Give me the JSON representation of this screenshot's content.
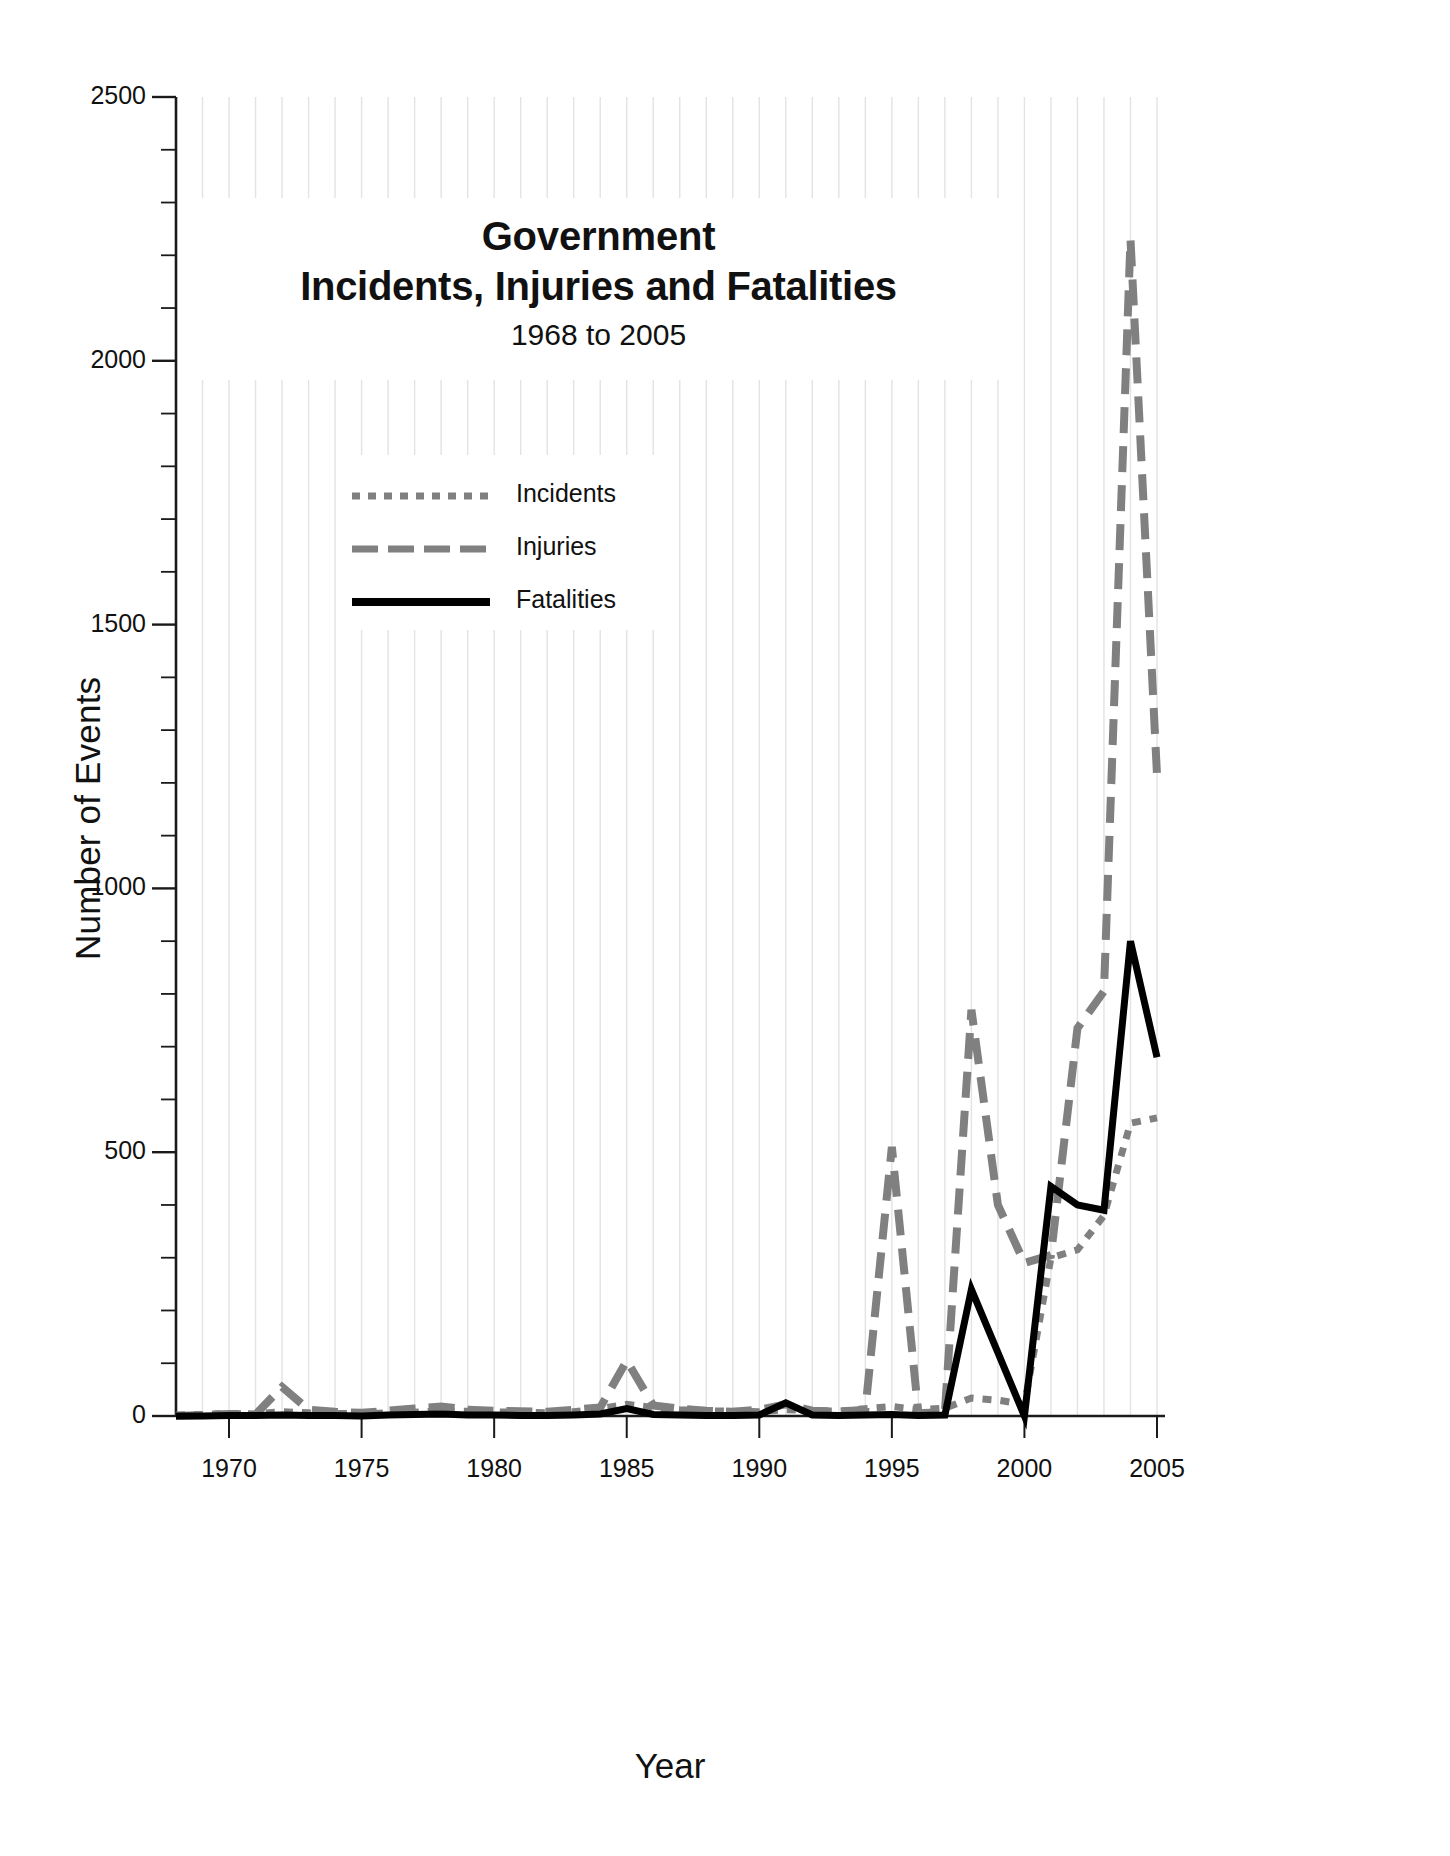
{
  "chart_data": {
    "type": "line",
    "title": "Government\nIncidents, Injuries and Fatalities",
    "title_line1": "Government",
    "title_line2": "Incidents, Injuries and Fatalities",
    "subtitle": "1968 to 2005",
    "xlabel": "Year",
    "ylabel": "Number of Events",
    "xlim": [
      1968,
      2005
    ],
    "ylim": [
      0,
      2500
    ],
    "yticks": [
      0,
      500,
      1000,
      1500,
      2000,
      2500
    ],
    "ytick_labels": [
      "0",
      "500",
      "1000",
      "1500",
      "2000",
      "2500"
    ],
    "y_minor_tick_step": 100,
    "xticks": [
      1970,
      1975,
      1980,
      1985,
      1990,
      1995,
      2000,
      2005
    ],
    "xtick_labels": [
      "1970",
      "1975",
      "1980",
      "1985",
      "1990",
      "1995",
      "2000",
      "2005"
    ],
    "x_minor_tick_step": 1,
    "grid": "vertical-minor-gridlines-only",
    "legend_position": "upper-left-inside",
    "x": [
      1968,
      1969,
      1970,
      1971,
      1972,
      1973,
      1974,
      1975,
      1976,
      1977,
      1978,
      1979,
      1980,
      1981,
      1982,
      1983,
      1984,
      1985,
      1986,
      1987,
      1988,
      1989,
      1990,
      1991,
      1992,
      1993,
      1994,
      1995,
      1996,
      1997,
      1998,
      1999,
      2000,
      2001,
      2002,
      2003,
      2004,
      2005
    ],
    "series": [
      {
        "name": "Incidents",
        "style": "dotted",
        "color": "#808080",
        "values": [
          2,
          3,
          5,
          4,
          8,
          6,
          5,
          4,
          6,
          7,
          10,
          9,
          8,
          7,
          6,
          8,
          14,
          22,
          16,
          12,
          10,
          9,
          8,
          12,
          10,
          9,
          14,
          18,
          12,
          15,
          34,
          30,
          22,
          300,
          315,
          380,
          555,
          565
        ]
      },
      {
        "name": "Injuries",
        "style": "dashed",
        "color": "#808080",
        "values": [
          0,
          2,
          4,
          3,
          55,
          12,
          8,
          6,
          10,
          14,
          18,
          12,
          10,
          9,
          8,
          12,
          16,
          105,
          20,
          14,
          10,
          8,
          12,
          22,
          10,
          8,
          12,
          510,
          5,
          8,
          770,
          400,
          290,
          305,
          735,
          805,
          2230,
          1215
        ]
      },
      {
        "name": "Fatalities",
        "style": "solid",
        "color": "#000000",
        "values": [
          0,
          0,
          1,
          1,
          2,
          1,
          1,
          0,
          2,
          3,
          4,
          2,
          2,
          1,
          1,
          2,
          4,
          14,
          3,
          2,
          1,
          1,
          2,
          25,
          2,
          1,
          2,
          3,
          1,
          2,
          240,
          120,
          0,
          435,
          400,
          390,
          900,
          680
        ]
      }
    ]
  },
  "axes": {
    "y_axis_title": "Number of Events",
    "x_axis_title": "Year"
  },
  "legend": {
    "items": [
      {
        "label": "Incidents"
      },
      {
        "label": "Injuries"
      },
      {
        "label": "Fatalities"
      }
    ]
  },
  "colors": {
    "series_gray": "#808080",
    "series_black": "#000000",
    "gridline": "#e3e3e3",
    "axis": "#1a1a1a",
    "text": "#111111"
  }
}
